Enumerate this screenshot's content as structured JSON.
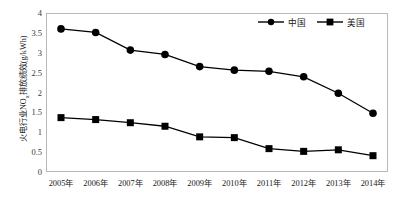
{
  "chart_data": {
    "type": "line",
    "title": "",
    "xlabel": "",
    "ylabel": "火电行业NOx排放绩效(g/kWh)",
    "ylabel_main": "火电行业NO",
    "ylabel_sub": "x",
    "ylabel_tail": "排放绩效(g/kWh)",
    "categories": [
      "2005年",
      "2006年",
      "2007年",
      "2008年",
      "2009年",
      "2010年",
      "2011年",
      "2012年",
      "2013年",
      "2014年"
    ],
    "ylim": [
      0,
      4
    ],
    "yticks": [
      "0",
      "0.5",
      "1",
      "1.5",
      "2",
      "2.5",
      "3",
      "3.5",
      "4"
    ],
    "ytick_values": [
      0,
      0.5,
      1,
      1.5,
      2,
      2.5,
      3,
      3.5,
      4
    ],
    "grid": false,
    "legend_position": "top-right",
    "series": [
      {
        "name": "中国",
        "marker": "circle",
        "color": "#000000",
        "values": [
          3.62,
          3.53,
          3.08,
          2.97,
          2.66,
          2.57,
          2.54,
          2.4,
          1.98,
          1.47
        ]
      },
      {
        "name": "美国",
        "marker": "square",
        "color": "#000000",
        "values": [
          1.36,
          1.31,
          1.23,
          1.14,
          0.87,
          0.85,
          0.57,
          0.5,
          0.54,
          0.39
        ]
      }
    ]
  },
  "legend": {
    "items": [
      {
        "label": "中国",
        "marker": "circle-marker-icon"
      },
      {
        "label": "美国",
        "marker": "square-marker-icon"
      }
    ]
  },
  "colors": {
    "series": "#000000",
    "frame": "#b9b9b9",
    "text": "#1a1a1a",
    "tick_text": "#3a3a3a",
    "background": "#ffffff"
  }
}
